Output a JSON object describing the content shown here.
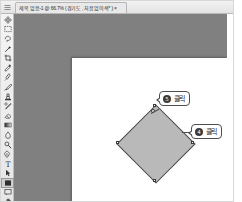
{
  "window": {
    "title_bar": {
      "corner_icon": "menu-icon",
      "tab_label": "제목 없음-1 @ 66.7% (경기도 , 처음없이색* ) ×",
      "tab_close_label": "×"
    }
  },
  "toolbar": {
    "name": "tool-palette",
    "tools": [
      {
        "id": "move-tool",
        "icon": "move-icon",
        "selected": false
      },
      {
        "id": "marquee-tool",
        "icon": "marquee-icon",
        "selected": false
      },
      {
        "id": "lasso-tool",
        "icon": "lasso-icon",
        "selected": false
      },
      {
        "id": "magic-wand-tool",
        "icon": "magic-wand-icon",
        "selected": false
      },
      {
        "id": "crop-tool",
        "icon": "crop-icon",
        "selected": false
      },
      {
        "id": "eyedropper-tool",
        "icon": "eyedropper-icon",
        "selected": false
      },
      {
        "id": "healing-brush-tool",
        "icon": "healing-brush-icon",
        "selected": false
      },
      {
        "id": "brush-tool",
        "icon": "brush-icon",
        "selected": false
      },
      {
        "id": "clone-stamp-tool",
        "icon": "clone-stamp-icon",
        "selected": false
      },
      {
        "id": "history-brush-tool",
        "icon": "history-brush-icon",
        "selected": false
      },
      {
        "id": "eraser-tool",
        "icon": "eraser-icon",
        "selected": false
      },
      {
        "id": "gradient-tool",
        "icon": "gradient-icon",
        "selected": false
      },
      {
        "id": "blur-tool",
        "icon": "blur-icon",
        "selected": false
      },
      {
        "id": "dodge-tool",
        "icon": "dodge-icon",
        "selected": false
      },
      {
        "id": "pen-tool",
        "icon": "pen-icon",
        "selected": false
      },
      {
        "id": "type-tool",
        "icon": "type-icon",
        "selected": false
      },
      {
        "id": "path-selection-tool",
        "icon": "path-selection-icon",
        "selected": false
      },
      {
        "id": "shape-tool",
        "icon": "shape-icon",
        "selected": true
      },
      {
        "id": "notes-tool",
        "icon": "notes-icon",
        "selected": false
      },
      {
        "id": "hand-tool",
        "icon": "hand-icon",
        "selected": false
      },
      {
        "id": "zoom-tool",
        "icon": "zoom-icon",
        "selected": false
      },
      {
        "id": "color-swatches",
        "icon": "color-swatch-icon",
        "selected": false
      }
    ]
  },
  "workspace": {
    "background_color": "#808080",
    "canvas": {
      "name": "document-canvas",
      "background_color": "#ffffff"
    },
    "shape": {
      "name": "rotated-square-shape",
      "fill_color": "#b9b9b9",
      "stroke_color": "#4a4a4a",
      "rotation_degrees": 45
    }
  },
  "callouts": [
    {
      "id": "callout-5",
      "number": "5",
      "label": "클릭"
    },
    {
      "id": "callout-4",
      "number": "4",
      "label": "클릭"
    }
  ]
}
